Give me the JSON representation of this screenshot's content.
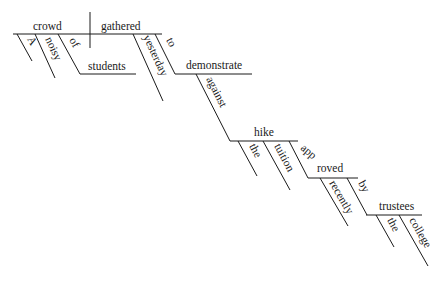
{
  "diagram": {
    "type": "sentence-diagram",
    "sentence_words": {
      "subject": "crowd",
      "verb": "gathered",
      "article_a": "A",
      "adj_noisy": "noisy",
      "prep_of": "of",
      "obj_students": "students",
      "adv_yesterday": "yesterday",
      "inf_to": "to",
      "inf_verb": "demonstrate",
      "prep_against": "against",
      "obj_hike": "hike",
      "article_the_1": "the",
      "adj_tuition": "tuition",
      "participle_app": "app",
      "participle_roved": "roved",
      "adv_recently": "recently",
      "prep_by": "by",
      "obj_trustees": "trustees",
      "article_the_2": "the",
      "adj_college": "college"
    },
    "line_color": "#1a1a1a",
    "background": "#ffffff"
  }
}
